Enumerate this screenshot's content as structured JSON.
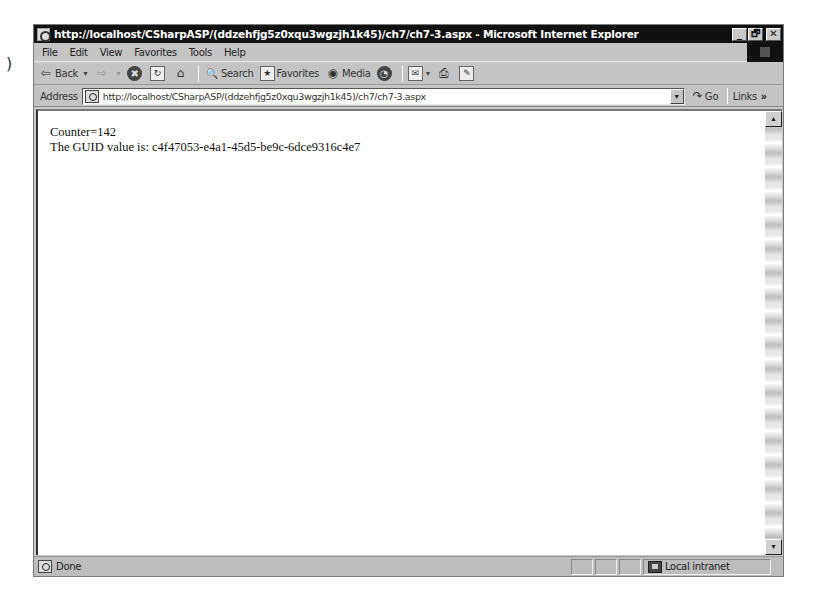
{
  "stray_mark": ")",
  "window": {
    "title": "http://localhost/CSharpASP/(ddzehfjg5z0xqu3wgzjh1k45)/ch7/ch7-3.aspx - Microsoft Internet Explorer",
    "controls": {
      "minimize": "_",
      "maximize": "🗗",
      "close": "✕"
    }
  },
  "menubar": {
    "items": [
      "File",
      "Edit",
      "View",
      "Favorites",
      "Tools",
      "Help"
    ]
  },
  "toolbar": {
    "back": {
      "label": "Back",
      "icon": "⇦"
    },
    "forward": {
      "icon": "⇨"
    },
    "stop": {
      "icon": "✖"
    },
    "refresh": {
      "icon": "↻"
    },
    "home": {
      "icon": "⌂"
    },
    "search": {
      "label": "Search",
      "icon": "🔍"
    },
    "favorites": {
      "label": "Favorites",
      "icon": "★"
    },
    "media": {
      "label": "Media",
      "icon": "◉"
    },
    "history": {
      "icon": "◔"
    },
    "mail": {
      "icon": "✉"
    },
    "print": {
      "icon": "⎙"
    },
    "edit": {
      "icon": "✎"
    },
    "dropdown_arrow": "▼"
  },
  "addressbar": {
    "label": "Address",
    "url": "http://localhost/CSharpASP/(ddzehfjg5z0xqu3wgzjh1k45)/ch7/ch7-3.aspx",
    "dropdown_arrow": "▼",
    "go_label": "Go",
    "go_icon": "↷",
    "links_label": "Links",
    "links_chevron": "»"
  },
  "content": {
    "lines": [
      "Counter=142",
      "The GUID value is: c4f47053-e4a1-45d5-be9c-6dce9316c4e7"
    ]
  },
  "scrollbar": {
    "up_arrow": "▲",
    "down_arrow": "▼"
  },
  "statusbar": {
    "status": "Done",
    "zone": "Local intranet"
  }
}
